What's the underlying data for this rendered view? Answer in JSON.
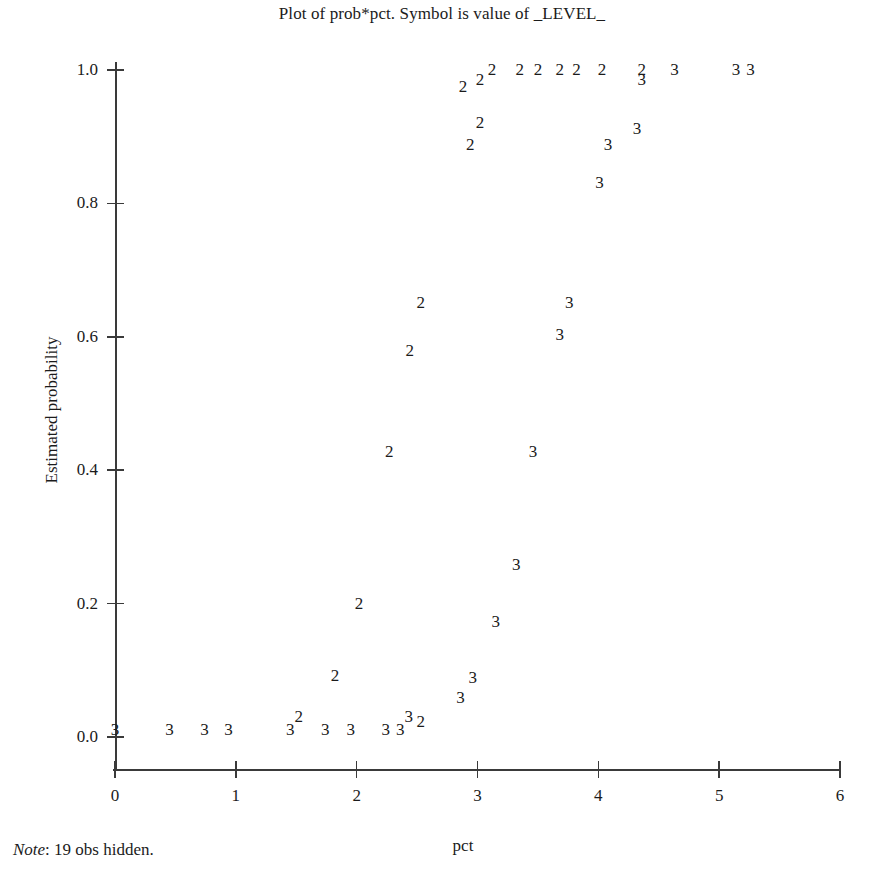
{
  "chart_data": {
    "type": "scatter",
    "title": "Plot of prob*pct. Symbol is value of _LEVEL_",
    "xlabel": "pct",
    "ylabel": "Estimated probability",
    "xlim": [
      0,
      6
    ],
    "ylim": [
      0.0,
      1.0
    ],
    "grid": false,
    "legend": "none",
    "note": {
      "label": "Note",
      "text": ": 19 obs hidden."
    },
    "xticks": [
      {
        "value": 0,
        "label": "0"
      },
      {
        "value": 1,
        "label": "1"
      },
      {
        "value": 2,
        "label": "2"
      },
      {
        "value": 3,
        "label": "3"
      },
      {
        "value": 4,
        "label": "4"
      },
      {
        "value": 5,
        "label": "5"
      },
      {
        "value": 6,
        "label": "6"
      }
    ],
    "yticks": [
      {
        "value": 0.0,
        "label": "0.0"
      },
      {
        "value": 0.2,
        "label": "0.2"
      },
      {
        "value": 0.4,
        "label": "0.4"
      },
      {
        "value": 0.6,
        "label": "0.6"
      },
      {
        "value": 0.8,
        "label": "0.8"
      },
      {
        "value": 1.0,
        "label": "1.0"
      }
    ],
    "symbol_field": "_LEVEL_",
    "series": [
      {
        "name": "2",
        "symbol": "2",
        "points": [
          {
            "x": 2.88,
            "y": 0.975
          },
          {
            "x": 3.02,
            "y": 0.985
          },
          {
            "x": 3.12,
            "y": 1.0
          },
          {
            "x": 3.35,
            "y": 1.0
          },
          {
            "x": 3.5,
            "y": 1.0
          },
          {
            "x": 3.68,
            "y": 1.0
          },
          {
            "x": 3.82,
            "y": 1.0
          },
          {
            "x": 4.03,
            "y": 1.0
          },
          {
            "x": 4.36,
            "y": 1.0
          },
          {
            "x": 3.02,
            "y": 0.92
          },
          {
            "x": 2.94,
            "y": 0.888
          },
          {
            "x": 2.53,
            "y": 0.65
          },
          {
            "x": 2.44,
            "y": 0.578
          },
          {
            "x": 2.27,
            "y": 0.428
          },
          {
            "x": 2.02,
            "y": 0.2
          },
          {
            "x": 1.82,
            "y": 0.092
          },
          {
            "x": 1.52,
            "y": 0.03
          },
          {
            "x": 2.53,
            "y": 0.022
          }
        ]
      },
      {
        "name": "3",
        "symbol": "3",
        "points": [
          {
            "x": 4.36,
            "y": 0.985
          },
          {
            "x": 4.63,
            "y": 1.0
          },
          {
            "x": 5.14,
            "y": 1.0
          },
          {
            "x": 5.26,
            "y": 1.0
          },
          {
            "x": 4.32,
            "y": 0.912
          },
          {
            "x": 4.08,
            "y": 0.887
          },
          {
            "x": 4.01,
            "y": 0.83
          },
          {
            "x": 3.76,
            "y": 0.65
          },
          {
            "x": 3.68,
            "y": 0.602
          },
          {
            "x": 3.46,
            "y": 0.428
          },
          {
            "x": 3.32,
            "y": 0.258
          },
          {
            "x": 3.15,
            "y": 0.172
          },
          {
            "x": 2.96,
            "y": 0.088
          },
          {
            "x": 2.86,
            "y": 0.058
          },
          {
            "x": 2.43,
            "y": 0.03
          },
          {
            "x": 0.0,
            "y": 0.01
          },
          {
            "x": 0.45,
            "y": 0.01
          },
          {
            "x": 0.74,
            "y": 0.01
          },
          {
            "x": 0.94,
            "y": 0.01
          },
          {
            "x": 1.45,
            "y": 0.01
          },
          {
            "x": 1.74,
            "y": 0.01
          },
          {
            "x": 1.95,
            "y": 0.01
          },
          {
            "x": 2.24,
            "y": 0.01
          },
          {
            "x": 2.36,
            "y": 0.01
          }
        ]
      }
    ]
  }
}
